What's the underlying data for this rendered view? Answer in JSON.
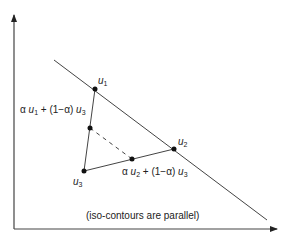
{
  "diagram": {
    "caption": "(iso-contours are parallel)",
    "colors": {
      "line": "#444444",
      "point": "#111111",
      "background": "#ffffff"
    },
    "axes": {
      "origin": [
        14,
        229
      ],
      "y_axis_top": [
        14,
        14
      ],
      "x_axis_right": [
        278,
        229
      ]
    },
    "iso_contour_line": {
      "from": [
        54,
        60
      ],
      "to": [
        267,
        220
      ]
    },
    "points": {
      "u1": {
        "name": "u",
        "sub": "1",
        "xy": [
          95,
          89
        ]
      },
      "u2": {
        "name": "u",
        "sub": "2",
        "xy": [
          174,
          149
        ]
      },
      "u3": {
        "name": "u",
        "sub": "3",
        "xy": [
          84,
          171
        ]
      },
      "mix13": {
        "xy": [
          90,
          128
        ]
      },
      "mix23": {
        "xy": [
          132,
          159
        ]
      }
    },
    "labels": {
      "u1": {
        "var": "u",
        "sub": "1"
      },
      "u2": {
        "var": "u",
        "sub": "2"
      },
      "u3": {
        "var": "u",
        "sub": "3"
      },
      "mix13": {
        "alpha": "α",
        "v1": "u",
        "s1": "1",
        "plus": " + (1−α) ",
        "v2": "u",
        "s2": "3"
      },
      "mix23": {
        "alpha": "α",
        "v1": "u",
        "s1": "2",
        "plus": " + (1−α) ",
        "v2": "u",
        "s2": "3"
      }
    }
  }
}
